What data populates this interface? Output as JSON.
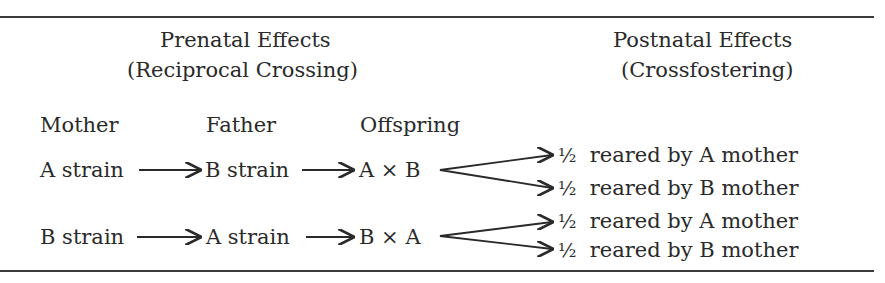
{
  "headers": {
    "prenatal_title": "Prenatal Effects",
    "prenatal_subtitle": "(Reciprocal Crossing)",
    "postnatal_title": "Postnatal Effects",
    "postnatal_subtitle": "(Crossfostering)"
  },
  "columns": {
    "mother": "Mother",
    "father": "Father",
    "offspring": "Offspring"
  },
  "rows": [
    {
      "mother": "A strain",
      "father": "B strain",
      "offspring": "A × B",
      "outcomes": [
        {
          "fraction": "½",
          "label": "reared by A mother"
        },
        {
          "fraction": "½",
          "label": "reared by B mother"
        }
      ]
    },
    {
      "mother": "B strain",
      "father": "A strain",
      "offspring": "B × A",
      "outcomes": [
        {
          "fraction": "½",
          "label": "reared by A mother"
        },
        {
          "fraction": "½",
          "label": "reared by B mother"
        }
      ]
    }
  ],
  "colors": {
    "text": "#2a2a2a",
    "rule": "#3a3a3a",
    "background": "#ffffff"
  }
}
